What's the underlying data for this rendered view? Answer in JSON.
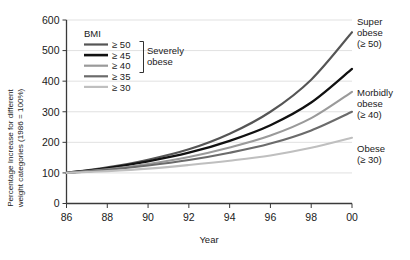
{
  "chart_data": {
    "type": "line",
    "title": "",
    "xlabel": "Year",
    "ylabel": "Percentage Increase for different weight categories (1986 = 100%)",
    "x": [
      86,
      88,
      90,
      92,
      94,
      96,
      98,
      100
    ],
    "x_tick_labels": [
      "86",
      "88",
      "90",
      "92",
      "94",
      "96",
      "98",
      "00"
    ],
    "y_tick_labels": [
      "0",
      "100",
      "200",
      "300",
      "400",
      "500",
      "600"
    ],
    "y_ticks": [
      0,
      100,
      200,
      300,
      400,
      500,
      600
    ],
    "xlim": [
      86,
      100
    ],
    "ylim": [
      0,
      600
    ],
    "grid": "horizontal",
    "legend_position": "inside-upper-left",
    "series": [
      {
        "name": "≥ 50",
        "color": "#555555",
        "width": 2.1,
        "values": [
          100,
          118,
          143,
          177,
          228,
          300,
          405,
          560
        ]
      },
      {
        "name": "≥ 45",
        "color": "#111111",
        "width": 2.3,
        "values": [
          100,
          116,
          138,
          166,
          205,
          256,
          330,
          440
        ]
      },
      {
        "name": "≥ 40",
        "color": "#9a9a9a",
        "width": 2.1,
        "values": [
          100,
          112,
          129,
          152,
          183,
          222,
          279,
          365
        ]
      },
      {
        "name": "≥ 35",
        "color": "#6b6b6b",
        "width": 2.1,
        "values": [
          100,
          110,
          124,
          142,
          166,
          196,
          239,
          300
        ]
      },
      {
        "name": "≥ 30",
        "color": "#bfbfbf",
        "width": 2.1,
        "values": [
          100,
          106,
          114,
          126,
          140,
          157,
          182,
          215
        ]
      }
    ]
  },
  "legend": {
    "heading": "BMI",
    "items": [
      {
        "label": "≥ 50",
        "color": "#555555"
      },
      {
        "label": "≥ 45",
        "color": "#111111"
      },
      {
        "label": "≥ 40",
        "color": "#9a9a9a"
      },
      {
        "label": "≥ 35",
        "color": "#6b6b6b"
      },
      {
        "label": "≥ 30",
        "color": "#bfbfbf"
      }
    ],
    "bracket_label_line1": "Severely",
    "bracket_label_line2": "obese"
  },
  "annotations": [
    {
      "line1": "Super",
      "line2": "obese",
      "line3": "(≥ 50)"
    },
    {
      "line1": "Morbidly",
      "line2": "obese",
      "line3": "(≥ 40)"
    },
    {
      "line1": "Obese",
      "line2": "(≥ 30)",
      "line3": ""
    }
  ],
  "axis": {
    "x_title": "Year",
    "y_title_line1": "Percentage Increase for different",
    "y_title_line2": "weight categories (1986 = 100%)"
  }
}
